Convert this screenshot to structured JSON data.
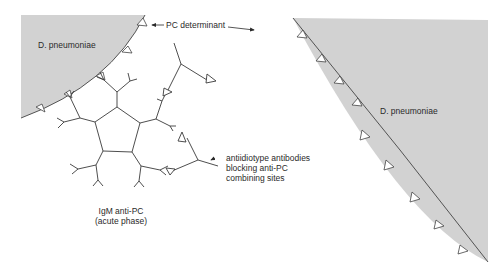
{
  "labels": {
    "cell_left": "D. pneumoniae",
    "cell_right": "D. pneumoniae",
    "pc_determinant": "PC determinant",
    "antiidiotype_line1": "antiidiotype antibodies",
    "antiidiotype_line2": "blocking anti-PC",
    "antiidiotype_line3": "combining sites",
    "igm_line1": "IgM anti-PC",
    "igm_line2": "(acute phase)"
  },
  "colors": {
    "cell_fill": "#d2d2d2",
    "line": "#3a3a3a",
    "text": "#2a2a2a",
    "background": "#ffffff"
  }
}
